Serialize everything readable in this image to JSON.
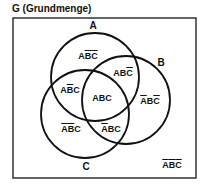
{
  "title": "G (Grundmenge)",
  "sets": {
    "A": {
      "label": "A",
      "cx": 95,
      "cy": 77,
      "r": 44
    },
    "B": {
      "label": "B",
      "cx": 126,
      "cy": 100,
      "r": 44
    },
    "C": {
      "label": "C",
      "cx": 85,
      "cy": 114,
      "r": 44
    }
  },
  "universe_rect": {
    "x": 13,
    "y": 18,
    "width": 183,
    "height": 160
  },
  "regions": [
    {
      "id": "A_notB_notC",
      "text": "AB̄C̄",
      "letters": [
        "A",
        "B",
        "C"
      ],
      "negated": [
        false,
        true,
        true
      ]
    },
    {
      "id": "A_B_notC",
      "text": "ABC̄",
      "letters": [
        "A",
        "B",
        "C"
      ],
      "negated": [
        false,
        false,
        true
      ]
    },
    {
      "id": "A_notB_C",
      "text": "AB̄C",
      "letters": [
        "A",
        "B",
        "C"
      ],
      "negated": [
        false,
        true,
        false
      ]
    },
    {
      "id": "A_B_C",
      "text": "ABC",
      "letters": [
        "A",
        "B",
        "C"
      ],
      "negated": [
        false,
        false,
        false
      ]
    },
    {
      "id": "notA_B_notC",
      "text": "ĀBC̄",
      "letters": [
        "A",
        "B",
        "C"
      ],
      "negated": [
        true,
        false,
        true
      ]
    },
    {
      "id": "notA_notB_C",
      "text": "ĀB̄C",
      "letters": [
        "A",
        "B",
        "C"
      ],
      "negated": [
        true,
        true,
        false
      ]
    },
    {
      "id": "notA_B_C",
      "text": "ĀBC",
      "letters": [
        "A",
        "B",
        "C"
      ],
      "negated": [
        true,
        false,
        false
      ]
    },
    {
      "id": "notA_notB_notC",
      "text": "ĀB̄C̄",
      "letters": [
        "A",
        "B",
        "C"
      ],
      "negated": [
        true,
        true,
        true
      ]
    }
  ]
}
